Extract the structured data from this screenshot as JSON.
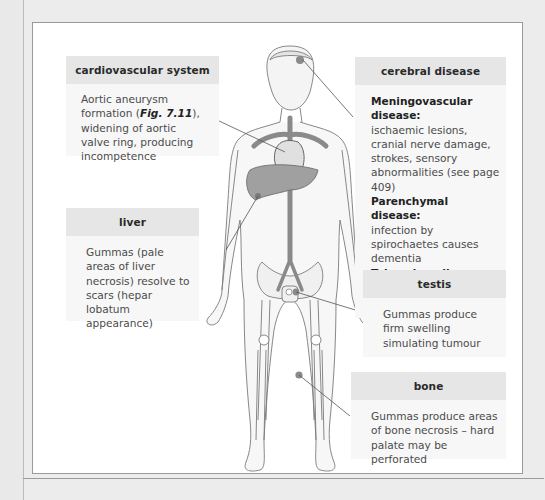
{
  "diagram": {
    "type": "anatomical-annotation"
  },
  "boxes": {
    "cardiovascular": {
      "title": "cardiovascular system",
      "text_pre": "Aortic aneurysm formation (",
      "fig_ref": "Fig. 7.11",
      "text_post": "), widening of aortic valve ring, producing incompetence"
    },
    "liver": {
      "title": "liver",
      "text": "Gummas (pale areas of liver necrosis) resolve to scars (hepar lobatum appearance)"
    },
    "cerebral": {
      "title": "cerebral disease",
      "items": [
        {
          "heading": "Meningovascular disease:",
          "text": "ischaemic lesions, cranial nerve damage, strokes, sensory abnormalities (see page 409)"
        },
        {
          "heading": "Parenchymal disease:",
          "text": "infection by spirochaetes causes dementia"
        },
        {
          "heading": "Tabes dorsalis:",
          "text": "Loss of spinal posterior columns"
        }
      ]
    },
    "testis": {
      "title": "testis",
      "text": "Gummas produce firm swelling simulating tumour"
    },
    "bone": {
      "title": "bone",
      "text": "Gummas produce areas of bone necrosis – hard palate may be perforated"
    }
  },
  "colors": {
    "panel_bg": "#ffffff",
    "header_bg": "#e6e6e6",
    "body_bg": "#f7f7f7",
    "lesion": "#8a8a8a",
    "organ": "#9a9a9a",
    "outline": "#7a7a7a"
  }
}
